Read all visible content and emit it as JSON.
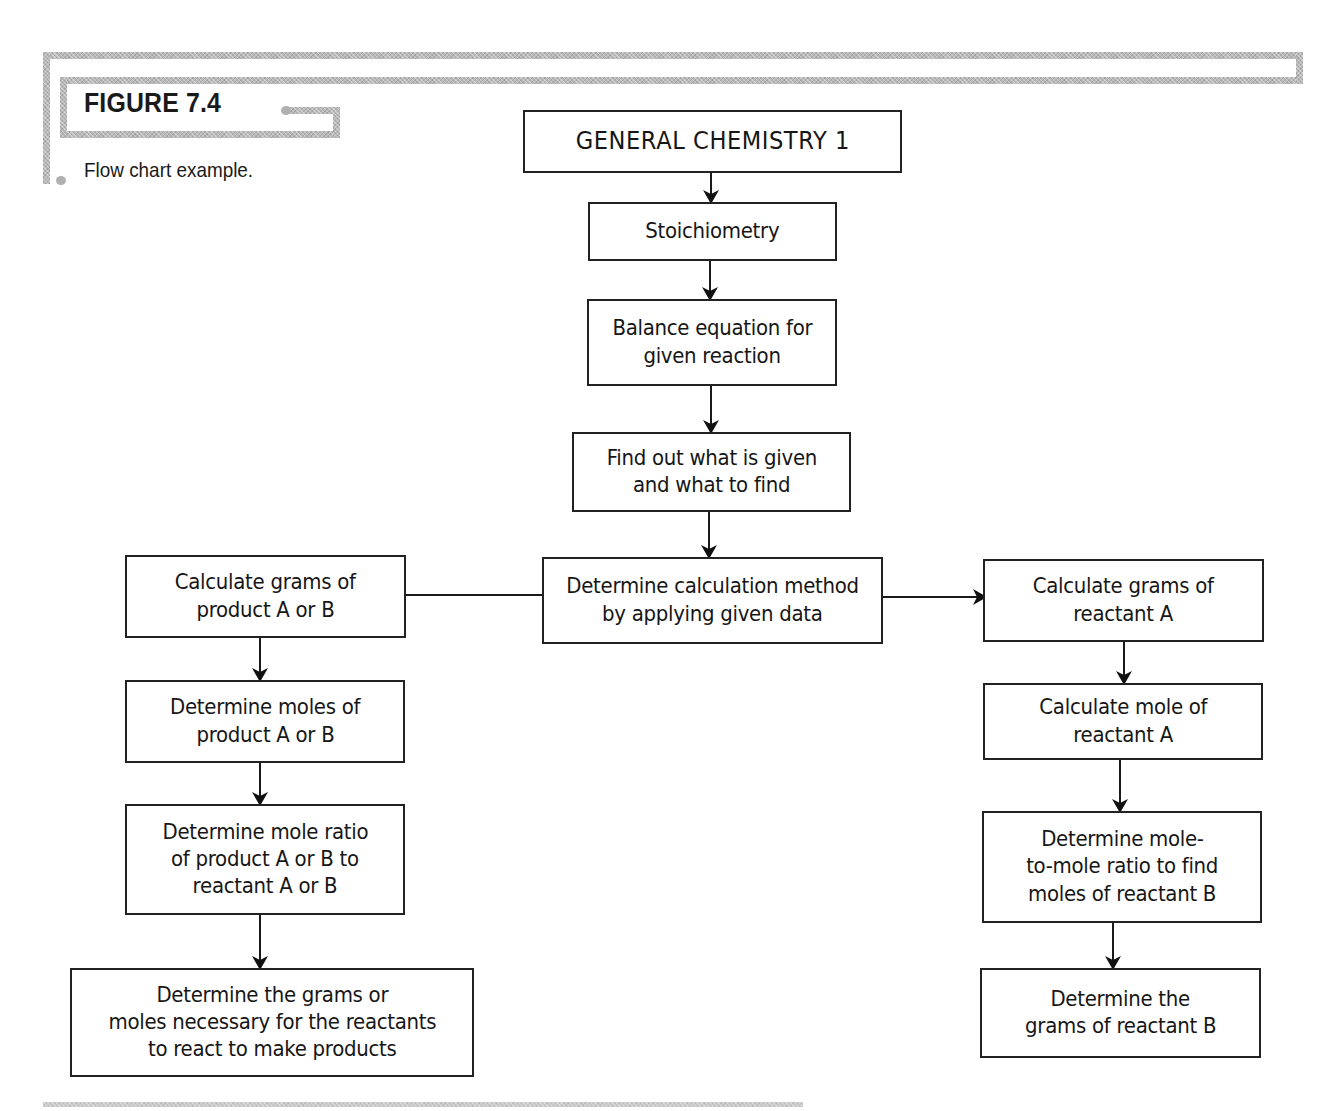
{
  "figure": {
    "label": "FIGURE 7.4",
    "caption": "Flow chart example."
  },
  "colors": {
    "frame": "#b9b9b9",
    "box_border": "#222222",
    "text": "#161616",
    "background": "#ffffff"
  },
  "flowchart": {
    "nodes": {
      "root": {
        "lines": [
          "GENERAL CHEMISTRY 1"
        ]
      },
      "stoichiometry": {
        "lines": [
          "Stoichiometry"
        ]
      },
      "balance": {
        "lines": [
          "Balance equation for",
          "given reaction"
        ]
      },
      "find": {
        "lines": [
          "Find out what is given",
          "and what to find"
        ]
      },
      "method": {
        "lines": [
          "Determine calculation method",
          "by applying given data"
        ]
      },
      "left": [
        {
          "lines": [
            "Calculate grams of",
            "product A or B"
          ]
        },
        {
          "lines": [
            "Determine moles of",
            "product A or B"
          ]
        },
        {
          "lines": [
            "Determine mole ratio",
            "of product A or B to",
            "reactant A or B"
          ]
        },
        {
          "lines": [
            "Determine the grams or",
            "moles necessary for the reactants",
            "to react to make products"
          ]
        }
      ],
      "right": [
        {
          "lines": [
            "Calculate grams of",
            "reactant A"
          ]
        },
        {
          "lines": [
            "Calculate mole of",
            "reactant A"
          ]
        },
        {
          "lines": [
            "Determine mole-",
            "to-mole ratio to find",
            "moles of reactant B"
          ]
        },
        {
          "lines": [
            "Determine the",
            "grams of reactant B"
          ]
        }
      ]
    },
    "edges": [
      [
        "root",
        "stoichiometry"
      ],
      [
        "stoichiometry",
        "balance"
      ],
      [
        "balance",
        "find"
      ],
      [
        "find",
        "method"
      ],
      [
        "method",
        "left.0"
      ],
      [
        "method",
        "right.0"
      ],
      [
        "left.0",
        "left.1"
      ],
      [
        "left.1",
        "left.2"
      ],
      [
        "left.2",
        "left.3"
      ],
      [
        "right.0",
        "right.1"
      ],
      [
        "right.1",
        "right.2"
      ],
      [
        "right.2",
        "right.3"
      ]
    ]
  }
}
